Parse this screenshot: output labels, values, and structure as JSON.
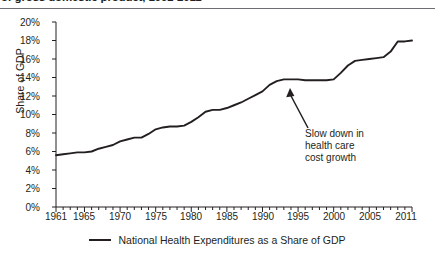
{
  "title": "of gross domestic product, 1961-2011",
  "axis": {
    "ylabel": "Share of GDP",
    "yticks": [
      "0%",
      "2%",
      "4%",
      "6%",
      "8%",
      "10%",
      "12%",
      "14%",
      "16%",
      "18%",
      "20%"
    ],
    "xticks": [
      "1961",
      "1965",
      "1970",
      "1975",
      "1980",
      "1985",
      "1990",
      "1995",
      "2000",
      "2005",
      "2011"
    ]
  },
  "annotation": {
    "line1": "Slow down in",
    "line2": "health care",
    "line3": "cost growth"
  },
  "legend": {
    "label": "National Health Expenditures as a Share of GDP"
  },
  "colors": {
    "line": "#231f20",
    "axis": "#231f20",
    "rule": "#6d6e71"
  },
  "chart_data": {
    "type": "line",
    "title": "of gross domestic product, 1961-2011",
    "xlabel": "",
    "ylabel": "Share of GDP",
    "xlim": [
      1961,
      2011
    ],
    "ylim": [
      0,
      20
    ],
    "grid": false,
    "legend_position": "bottom-center",
    "annotations": [
      {
        "text": "Slow down in health care cost growth",
        "points_to_x": 1994,
        "points_to_y": 13.8
      }
    ],
    "series": [
      {
        "name": "National Health Expenditures as a Share of GDP",
        "x": [
          1961,
          1962,
          1963,
          1964,
          1965,
          1966,
          1967,
          1968,
          1969,
          1970,
          1971,
          1972,
          1973,
          1974,
          1975,
          1976,
          1977,
          1978,
          1979,
          1980,
          1981,
          1982,
          1983,
          1984,
          1985,
          1986,
          1987,
          1988,
          1989,
          1990,
          1991,
          1992,
          1993,
          1994,
          1995,
          1996,
          1997,
          1998,
          1999,
          2000,
          2001,
          2002,
          2003,
          2004,
          2005,
          2006,
          2007,
          2008,
          2009,
          2010,
          2011
        ],
        "values": [
          5.6,
          5.7,
          5.8,
          5.9,
          5.9,
          6.0,
          6.3,
          6.5,
          6.7,
          7.1,
          7.3,
          7.5,
          7.5,
          7.9,
          8.4,
          8.6,
          8.7,
          8.7,
          8.8,
          9.2,
          9.7,
          10.3,
          10.5,
          10.5,
          10.7,
          11.0,
          11.3,
          11.7,
          12.1,
          12.5,
          13.2,
          13.6,
          13.8,
          13.8,
          13.8,
          13.7,
          13.7,
          13.7,
          13.7,
          13.8,
          14.5,
          15.3,
          15.8,
          15.9,
          16.0,
          16.1,
          16.2,
          16.8,
          17.9,
          17.9,
          18.0
        ]
      }
    ]
  }
}
